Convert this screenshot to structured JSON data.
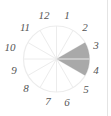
{
  "chart_data": {
    "type": "polar-sector-clock",
    "title": "",
    "center": [
      56.5,
      59
    ],
    "radius": 33,
    "sector_count": 12,
    "sector_labels": [
      "12",
      "1",
      "2",
      "3",
      "4",
      "5",
      "6",
      "7",
      "8",
      "9",
      "10",
      "11"
    ],
    "highlighted_sectors": [
      "3",
      "4"
    ],
    "highlight_span_degrees_clockwise_from_top": [
      60,
      120
    ],
    "grid_lines": true
  },
  "colors": {
    "highlight_fill": "#a9a9a9",
    "grid_line": "#ececec",
    "label": "#555555",
    "background": "#ffffff"
  },
  "labels": [
    {
      "text": "12",
      "x": 44,
      "y": 19
    },
    {
      "text": "1",
      "x": 67,
      "y": 19
    },
    {
      "text": "2",
      "x": 85,
      "y": 31
    },
    {
      "text": "3",
      "x": 96,
      "y": 49
    },
    {
      "text": "4",
      "x": 96,
      "y": 74
    },
    {
      "text": "5",
      "x": 86,
      "y": 93
    },
    {
      "text": "6",
      "x": 67,
      "y": 106
    },
    {
      "text": "7",
      "x": 48,
      "y": 105
    },
    {
      "text": "8",
      "x": 26,
      "y": 92
    },
    {
      "text": "9",
      "x": 14,
      "y": 74
    },
    {
      "text": "10",
      "x": 10,
      "y": 51
    },
    {
      "text": "11",
      "x": 25,
      "y": 31
    }
  ]
}
